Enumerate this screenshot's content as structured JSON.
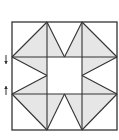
{
  "diagram": {
    "type": "quilt-block",
    "colors": {
      "background": "#ffffff",
      "fill": "#e6e6e6",
      "stroke": "#333333"
    },
    "grid": {
      "x": [
        12,
        47,
        82,
        117
      ],
      "y": [
        22,
        57,
        94,
        130
      ]
    },
    "shaded_regions": [
      {
        "name": "top-left-lower-triangle",
        "points": "12,57 47,22 47,57"
      },
      {
        "name": "top-right-lower-triangle",
        "points": "82,22 117,57 82,57"
      },
      {
        "name": "bottom-left-upper-triangle",
        "points": "12,94 47,94 47,130"
      },
      {
        "name": "bottom-right-upper-triangle",
        "points": "82,94 117,94 82,130"
      },
      {
        "name": "top-center-left-triangle",
        "points": "47,22 64.5,57 47,57"
      },
      {
        "name": "top-center-right-triangle",
        "points": "82,22 82,57 64.5,57"
      },
      {
        "name": "bottom-center-left-triangle",
        "points": "47,94 64.5,94 47,130"
      },
      {
        "name": "bottom-center-right-triangle",
        "points": "64.5,94 82,94 82,130"
      },
      {
        "name": "left-middle-top-triangle",
        "points": "12,57 47,57 47,75.5"
      },
      {
        "name": "left-middle-bottom-triangle",
        "points": "47,75.5 47,94 12,94"
      },
      {
        "name": "right-middle-top-triangle",
        "points": "82,57 117,57 82,75.5"
      },
      {
        "name": "right-middle-bottom-triangle",
        "points": "82,75.5 82,94 117,94"
      }
    ],
    "lines": [
      {
        "name": "top-left-diagonal",
        "x1": 12,
        "y1": 57,
        "x2": 47,
        "y2": 22
      },
      {
        "name": "top-right-diagonal",
        "x1": 82,
        "y1": 22,
        "x2": 117,
        "y2": 57
      },
      {
        "name": "bottom-left-diagonal",
        "x1": 12,
        "y1": 94,
        "x2": 47,
        "y2": 130
      },
      {
        "name": "bottom-right-diagonal",
        "x1": 82,
        "y1": 130,
        "x2": 117,
        "y2": 94
      },
      {
        "name": "top-center-v-left",
        "x1": 47,
        "y1": 22,
        "x2": 64.5,
        "y2": 57
      },
      {
        "name": "top-center-v-right",
        "x1": 64.5,
        "y1": 57,
        "x2": 82,
        "y2": 22
      },
      {
        "name": "bottom-center-v-left",
        "x1": 47,
        "y1": 130,
        "x2": 64.5,
        "y2": 94
      },
      {
        "name": "bottom-center-v-right",
        "x1": 64.5,
        "y1": 94,
        "x2": 82,
        "y2": 130
      },
      {
        "name": "left-middle-upper",
        "x1": 12,
        "y1": 57,
        "x2": 47,
        "y2": 75.5
      },
      {
        "name": "left-middle-lower",
        "x1": 47,
        "y1": 75.5,
        "x2": 12,
        "y2": 94
      },
      {
        "name": "right-middle-upper",
        "x1": 117,
        "y1": 57,
        "x2": 82,
        "y2": 75.5
      },
      {
        "name": "right-middle-lower",
        "x1": 82,
        "y1": 75.5,
        "x2": 117,
        "y2": 94
      }
    ],
    "arrows": [
      {
        "name": "down-arrow",
        "direction": "down",
        "x": 6,
        "y1": 55,
        "y2": 64
      },
      {
        "name": "up-arrow",
        "direction": "up",
        "x": 6,
        "y1": 95,
        "y2": 86
      }
    ]
  }
}
